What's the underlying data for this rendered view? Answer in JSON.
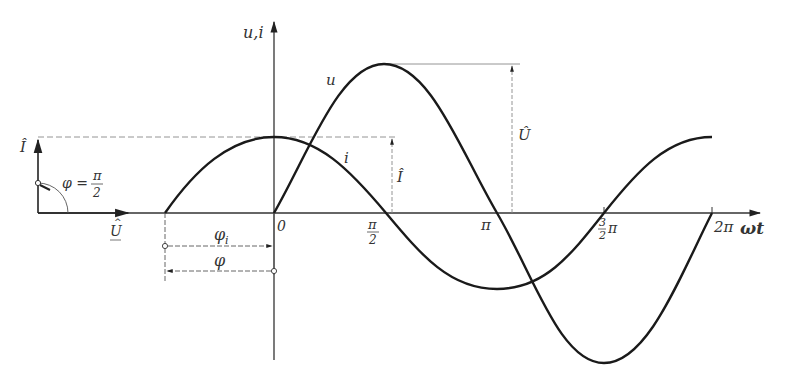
{
  "diagram": {
    "y_axis_label": "u,i",
    "x_axis_label": "ωt",
    "curve_u_label": "u",
    "curve_i_label": "i",
    "ticks": {
      "origin": "0",
      "half_pi_num": "π",
      "half_pi_den": "2",
      "pi": "π",
      "three_half_pi_num": "3",
      "three_half_pi_den": "2",
      "three_half_pi_suffix": "π",
      "two_pi": "2π"
    },
    "amplitude_u_label": "Û",
    "amplitude_i_label": "Î",
    "phasor": {
      "current_label": "Î",
      "voltage_label": "U",
      "angle_label_prefix": "φ =",
      "angle_num": "π",
      "angle_den": "2"
    },
    "phase_shift": {
      "phi_i_label": "φ",
      "phi_i_sub": "i",
      "phi_label": "φ"
    },
    "colors": {
      "curve": "#1a1a1a",
      "axis": "#333333",
      "guide": "#888888",
      "text": "#333333"
    }
  }
}
